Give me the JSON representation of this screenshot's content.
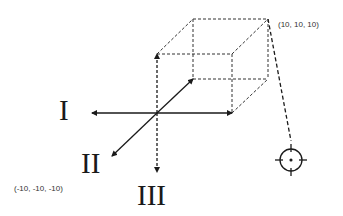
{
  "diagram": {
    "axis_labels": {
      "axis_1": "I",
      "axis_2": "II",
      "axis_3": "III"
    },
    "corner_labels": {
      "max": "(10, 10, 10)",
      "min": "(-10, -10, -10)"
    },
    "elements": {
      "cube": "dashed wireframe cube",
      "target": "crosshair-icon"
    },
    "colors": {
      "line": "#1a1a1a",
      "text": "#333333",
      "background": "#ffffff"
    }
  }
}
